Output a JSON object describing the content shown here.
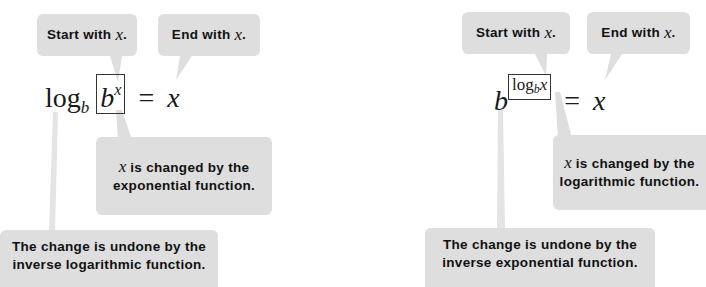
{
  "left": {
    "start_label": "Start with",
    "end_label": "End with",
    "var": "x",
    "equation": {
      "log": "log",
      "base": "b",
      "boxed_base": "b",
      "boxed_exp": "x",
      "equals": "=",
      "rhs": "x"
    },
    "changed": {
      "line1_rest": " is changed by the",
      "line2": "exponential function."
    },
    "undone": {
      "line1": "The change is undone by the",
      "line2": "inverse logarithmic function."
    }
  },
  "right": {
    "start_label": "Start with",
    "end_label": "End with",
    "var": "x",
    "equation": {
      "base": "b",
      "boxed_log": "log",
      "boxed_sub": "b",
      "boxed_arg": "x",
      "equals": "=",
      "rhs": "x"
    },
    "changed": {
      "line1_rest": " is changed by the",
      "line2": "logarithmic function."
    },
    "undone": {
      "line1": "The change is undone by the",
      "line2": "inverse exponential function."
    }
  },
  "colors": {
    "bubble": "#dedede",
    "text": "#111111",
    "background": "#ffffff"
  }
}
